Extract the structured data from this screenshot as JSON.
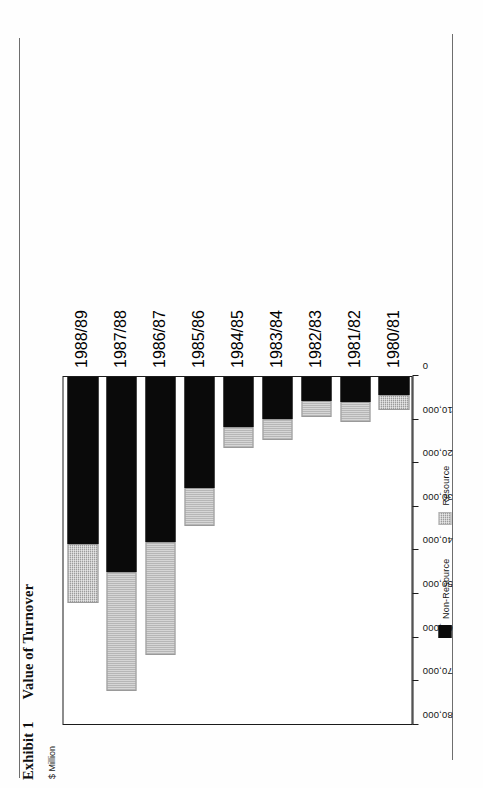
{
  "document": {
    "exhibit_label": "Exhibit 1",
    "title": "Value of Turnover",
    "unit_label": "$ Million"
  },
  "legend": {
    "position": "bottom-center",
    "items": [
      {
        "label": "Non-Resource",
        "swatch": "black-swatch-icon",
        "color": "#0a0a0a"
      },
      {
        "label": "Resource",
        "swatch": "grey-hatch-swatch-icon",
        "color": "#c6c6c6"
      }
    ]
  },
  "axis": {
    "value_ticks": [
      "80,000",
      "70,000",
      "60,000",
      "50,000",
      "40,000",
      "30,000",
      "20,000",
      "10,000",
      "0"
    ],
    "value_min": 0,
    "value_max": 80000,
    "value_step": 10000
  },
  "chart_data": {
    "type": "bar",
    "orientation": "horizontal",
    "stacked": true,
    "title": "Value of Turnover",
    "subtitle": "Exhibit 1",
    "xlabel": "$ Million",
    "ylabel": "",
    "grid": false,
    "legend_position": "bottom-center",
    "xlim": [
      0,
      80000
    ],
    "xticks": [
      0,
      10000,
      20000,
      30000,
      40000,
      50000,
      60000,
      70000,
      80000
    ],
    "xticklabels": [
      "0",
      "10,000",
      "20,000",
      "30,000",
      "40,000",
      "50,000",
      "60,000",
      "70,000",
      "80,000"
    ],
    "categories": [
      "1980/81",
      "1981/82",
      "1982/83",
      "1983/84",
      "1984/85",
      "1985/86",
      "1986/87",
      "1987/88",
      "1988/89"
    ],
    "series": [
      {
        "name": "Non-Resource",
        "color": "#0a0a0a",
        "values": [
          4200,
          5800,
          5400,
          9600,
          11400,
          25400,
          37800,
          44600,
          38300
        ]
      },
      {
        "name": "Resource",
        "color": "#c6c6c6",
        "values": [
          3400,
          4600,
          3700,
          4900,
          4900,
          8700,
          25900,
          27400,
          13400
        ]
      }
    ],
    "totals": [
      7600,
      10400,
      9100,
      14500,
      16300,
      34100,
      63700,
      72000,
      51700
    ]
  }
}
